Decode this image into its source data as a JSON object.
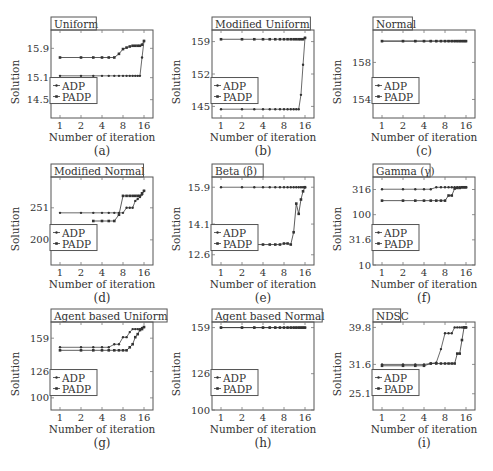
{
  "figure": {
    "xlabel": "Number of iteration",
    "ylabel": "Solution",
    "legend": [
      "ADP",
      "PADP"
    ],
    "xticks": [
      "1",
      "2",
      "4",
      "8",
      "16"
    ]
  },
  "chart_data": [
    {
      "id": "a",
      "caption": "(a)",
      "title": "Uniform",
      "type": "line",
      "xlabel": "Number of iteration",
      "ylabel": "Solution",
      "xscale": "log2",
      "xlim": [
        1,
        16
      ],
      "ylim": [
        14.0,
        16.4
      ],
      "yticks": [
        14.5,
        15.1,
        15.9
      ],
      "ytick_labels": [
        "14.5",
        "15.1",
        "15.9"
      ],
      "series": [
        {
          "name": "ADP",
          "x": [
            1,
            2,
            3,
            4,
            5,
            6,
            7,
            8,
            9,
            10,
            11,
            12,
            13,
            14,
            15,
            16
          ],
          "y": [
            15.15,
            15.15,
            15.15,
            15.15,
            15.15,
            15.15,
            15.15,
            15.15,
            15.15,
            15.15,
            15.15,
            15.15,
            15.15,
            15.15,
            15.65,
            16.1
          ]
        },
        {
          "name": "PADP",
          "x": [
            1,
            2,
            3,
            4,
            5,
            6,
            7,
            8,
            9,
            10,
            11,
            12,
            13,
            14,
            15,
            16
          ],
          "y": [
            15.65,
            15.65,
            15.65,
            15.65,
            15.65,
            15.65,
            15.75,
            15.88,
            15.92,
            15.95,
            15.97,
            15.97,
            15.97,
            15.97,
            16.0,
            16.1
          ]
        }
      ]
    },
    {
      "id": "b",
      "caption": "(b)",
      "title": "Modified Uniform",
      "type": "line",
      "xlabel": "Number of iteration",
      "ylabel": "Solution",
      "xscale": "log2",
      "xlim": [
        1,
        16
      ],
      "ylim": [
        142.5,
        161.5
      ],
      "yticks": [
        145,
        152,
        159
      ],
      "ytick_labels": [
        "145",
        "152",
        "159"
      ],
      "series": [
        {
          "name": "ADP",
          "x": [
            1,
            2,
            3,
            4,
            5,
            6,
            7,
            8,
            9,
            10,
            11,
            12,
            13,
            14,
            15,
            16
          ],
          "y": [
            144.4,
            144.4,
            144.4,
            144.4,
            144.4,
            144.4,
            144.4,
            144.4,
            144.4,
            144.4,
            144.4,
            144.4,
            144.4,
            147.5,
            154.0,
            159.8
          ]
        },
        {
          "name": "PADP",
          "x": [
            1,
            2,
            3,
            4,
            5,
            6,
            7,
            8,
            9,
            10,
            11,
            12,
            13,
            14,
            15,
            16
          ],
          "y": [
            159.5,
            159.5,
            159.5,
            159.5,
            159.5,
            159.5,
            159.5,
            159.5,
            159.5,
            159.5,
            159.5,
            159.5,
            159.5,
            159.5,
            159.5,
            159.8
          ]
        }
      ]
    },
    {
      "id": "c",
      "caption": "(c)",
      "title": "Normal",
      "type": "line",
      "xlabel": "Number of iteration",
      "ylabel": "Solution",
      "xscale": "log2",
      "xlim": [
        1,
        16
      ],
      "ylim": [
        152.0,
        161.5
      ],
      "yticks": [
        154,
        158
      ],
      "ytick_labels": [
        "154",
        "158"
      ],
      "series": [
        {
          "name": "ADP",
          "x": [
            1,
            2,
            3,
            4,
            5,
            6,
            7,
            8,
            9,
            10,
            11,
            12,
            13,
            14,
            15,
            16
          ],
          "y": [
            160.3,
            160.3,
            160.3,
            160.3,
            160.3,
            160.3,
            160.3,
            160.3,
            160.3,
            160.3,
            160.3,
            160.3,
            160.3,
            160.3,
            160.3,
            160.3
          ]
        },
        {
          "name": "PADP",
          "x": [
            1,
            2,
            3,
            4,
            5,
            6,
            7,
            8,
            9,
            10,
            11,
            12,
            13,
            14,
            15,
            16
          ],
          "y": [
            160.3,
            160.3,
            160.3,
            160.3,
            160.3,
            160.3,
            160.3,
            160.3,
            160.3,
            160.3,
            160.3,
            160.3,
            160.3,
            160.3,
            160.3,
            160.3
          ]
        }
      ]
    },
    {
      "id": "d",
      "caption": "(d)",
      "title": "Modified Normal",
      "type": "line",
      "xlabel": "Number of iteration",
      "ylabel": "Solution",
      "xscale": "log",
      "xlim": [
        1,
        16
      ],
      "ylim": [
        160,
        300
      ],
      "yticks": [
        200,
        251
      ],
      "ytick_labels": [
        "200",
        "251"
      ],
      "series": [
        {
          "name": "ADP",
          "x": [
            1,
            2,
            3,
            4,
            5,
            6,
            7,
            8,
            9,
            10,
            11,
            12,
            13,
            14,
            15,
            16
          ],
          "y": [
            243,
            243,
            243,
            243,
            243,
            243,
            243,
            243,
            251,
            251,
            251,
            262,
            265,
            268,
            272,
            278
          ]
        },
        {
          "name": "PADP",
          "x": [
            1,
            2,
            3,
            4,
            5,
            6,
            7,
            8,
            9,
            10,
            11,
            12,
            13,
            14,
            15,
            16
          ],
          "y": [
            null,
            null,
            230,
            230,
            230,
            230,
            240,
            270,
            270,
            270,
            270,
            270,
            270,
            270,
            274,
            278
          ]
        }
      ]
    },
    {
      "id": "e",
      "caption": "(e)",
      "title": "Beta (β)",
      "type": "line",
      "xlabel": "Number of iteration",
      "ylabel": "Solution",
      "xscale": "log2",
      "xlim": [
        1,
        16
      ],
      "ylim": [
        12.1,
        16.4
      ],
      "yticks": [
        12.6,
        14.1,
        15.9
      ],
      "ytick_labels": [
        "12.6",
        "14.1",
        "15.9"
      ],
      "series": [
        {
          "name": "ADP",
          "x": [
            1,
            2,
            3,
            4,
            5,
            6,
            7,
            8,
            9,
            10,
            11,
            12,
            13,
            14,
            15,
            16
          ],
          "y": [
            15.9,
            15.9,
            15.9,
            15.9,
            15.9,
            15.9,
            15.9,
            15.9,
            15.9,
            15.9,
            15.9,
            15.9,
            15.9,
            15.9,
            15.9,
            15.9
          ]
        },
        {
          "name": "PADP",
          "x": [
            3,
            4,
            5,
            6,
            7,
            8,
            9,
            10,
            11,
            12,
            13,
            14,
            15,
            16
          ],
          "y": [
            13.1,
            13.1,
            13.1,
            13.1,
            13.1,
            13.15,
            13.15,
            13.1,
            13.7,
            15.1,
            14.6,
            15.3,
            15.7,
            15.9
          ]
        }
      ]
    },
    {
      "id": "f",
      "caption": "(f)",
      "title": "Gamma (γ)",
      "type": "line",
      "xlabel": "Number of iteration",
      "ylabel": "Solution",
      "xscale": "log2",
      "yscale": "log",
      "xlim": [
        1,
        16
      ],
      "ylim": [
        10,
        560
      ],
      "yticks": [
        10,
        31.6,
        100,
        316
      ],
      "ytick_labels": [
        "10",
        "31.6",
        "100",
        "316"
      ],
      "series": [
        {
          "name": "ADP",
          "x": [
            1,
            2,
            3,
            4,
            5,
            6,
            7,
            8,
            9,
            10,
            11,
            12,
            13,
            14,
            15,
            16
          ],
          "y": [
            320,
            320,
            320,
            320,
            320,
            350,
            350,
            350,
            350,
            350,
            350,
            350,
            350,
            350,
            350,
            350
          ]
        },
        {
          "name": "PADP",
          "x": [
            1,
            2,
            3,
            4,
            5,
            6,
            7,
            8,
            9,
            10,
            11,
            12,
            13,
            14,
            15,
            16
          ],
          "y": [
            190,
            190,
            190,
            190,
            190,
            190,
            190,
            190,
            240,
            240,
            330,
            340,
            340,
            350,
            350,
            350
          ]
        }
      ]
    },
    {
      "id": "g",
      "caption": "(g)",
      "title": "Agent based Uniform",
      "type": "line",
      "xlabel": "Number of iteration",
      "ylabel": "Solution",
      "xscale": "log2",
      "xlim": [
        1,
        16
      ],
      "ylim": [
        88,
        175
      ],
      "yticks": [
        100,
        126,
        159
      ],
      "ytick_labels": [
        "100",
        "126",
        "159"
      ],
      "series": [
        {
          "name": "ADP",
          "x": [
            1,
            2,
            3,
            4,
            5,
            6,
            7,
            8,
            9,
            10,
            11,
            12,
            13,
            14,
            15,
            16
          ],
          "y": [
            150,
            150,
            150,
            150,
            150,
            153,
            153,
            160,
            160,
            165,
            168,
            168,
            168,
            168,
            169,
            170
          ]
        },
        {
          "name": "PADP",
          "x": [
            1,
            2,
            3,
            4,
            5,
            6,
            7,
            8,
            9,
            10,
            11,
            12,
            13,
            14,
            15,
            16
          ],
          "y": [
            147,
            147,
            147,
            147,
            147,
            147,
            147,
            147,
            147,
            150,
            153,
            160,
            163,
            167,
            168,
            170
          ]
        }
      ]
    },
    {
      "id": "h",
      "caption": "(h)",
      "title": "Agent based Normal",
      "type": "line",
      "xlabel": "Number of iteration",
      "ylabel": "Solution",
      "xscale": "log2",
      "xlim": [
        1,
        16
      ],
      "ylim": [
        100,
        163
      ],
      "yticks": [
        100,
        126,
        159
      ],
      "ytick_labels": [
        "100",
        "126",
        "159"
      ],
      "series": [
        {
          "name": "ADP",
          "x": [
            1,
            2,
            3,
            4,
            5,
            6,
            7,
            8,
            9,
            10,
            11,
            12,
            13,
            14,
            15,
            16
          ],
          "y": [
            159,
            159,
            159,
            159,
            159,
            159,
            159,
            159,
            159,
            159,
            159,
            159,
            159,
            159,
            159,
            159
          ]
        },
        {
          "name": "PADP",
          "x": [
            1,
            2,
            3,
            4,
            5,
            6,
            7,
            8,
            9,
            10,
            11,
            12,
            13,
            14,
            15,
            16
          ],
          "y": [
            159,
            159,
            159,
            159,
            159,
            159,
            159,
            159,
            159,
            159,
            159,
            159,
            159,
            159,
            159,
            159
          ]
        }
      ]
    },
    {
      "id": "i",
      "caption": "(i)",
      "title": "NDSC",
      "type": "line",
      "xlabel": "Number of iteration",
      "ylabel": "Solution",
      "xscale": "log2",
      "xlim": [
        1,
        16
      ],
      "ylim": [
        21.5,
        41.0
      ],
      "yticks": [
        25.1,
        31.6,
        39.8
      ],
      "ytick_labels": [
        "25.1",
        "31.6",
        "39.8"
      ],
      "series": [
        {
          "name": "ADP",
          "x": [
            1,
            2,
            3,
            4,
            5,
            6,
            7,
            8,
            9,
            10,
            11,
            12,
            13,
            14,
            15,
            16
          ],
          "y": [
            31.6,
            31.6,
            31.6,
            31.6,
            31.8,
            32.0,
            35.0,
            38.5,
            38.5,
            38.5,
            39.8,
            39.8,
            39.8,
            39.8,
            39.8,
            39.8
          ]
        },
        {
          "name": "PADP",
          "x": [
            1,
            2,
            3,
            4,
            5,
            6,
            7,
            8,
            9,
            10,
            11,
            12,
            13,
            14,
            15,
            16
          ],
          "y": [
            31.3,
            31.3,
            31.3,
            31.3,
            31.8,
            31.8,
            31.8,
            31.8,
            31.8,
            31.8,
            31.8,
            34.0,
            34.0,
            37.0,
            39.8,
            39.8
          ]
        }
      ]
    }
  ]
}
